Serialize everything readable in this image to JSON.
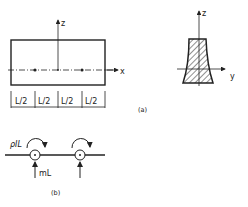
{
  "figure_a": {
    "caption": "(a)",
    "beam": {
      "axis_z_label": "z",
      "axis_x_label": "x",
      "segments": [
        "L/2",
        "L/2",
        "L/2",
        "L/2"
      ]
    },
    "section": {
      "axis_z_label": "z",
      "axis_y_label": "y"
    }
  },
  "figure_b": {
    "caption": "(b)",
    "moment_label": "ρIL",
    "force_label": "mL"
  },
  "colors": {
    "line": "#222222",
    "background": "#ffffff"
  }
}
